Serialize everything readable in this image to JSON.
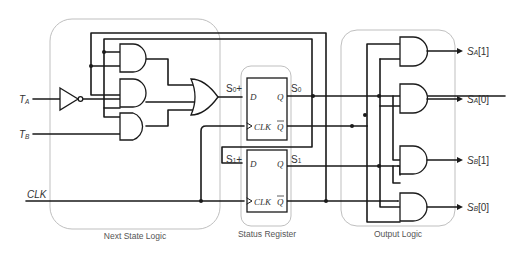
{
  "diagram": {
    "groups": {
      "next_state": "Next State Logic",
      "status_register": "Status Register",
      "output_logic": "Output Logic"
    },
    "inputs": {
      "ta": {
        "main": "T",
        "sub": "A"
      },
      "tb": {
        "main": "T",
        "sub": "B"
      },
      "clk": "CLK"
    },
    "signals": {
      "s0_plus": {
        "main": "S",
        "sub": "0",
        "suffix": "+"
      },
      "s1_plus": {
        "main": "S",
        "sub": "1",
        "suffix": "+"
      },
      "s0": {
        "main": "S",
        "sub": "0"
      },
      "s1": {
        "main": "S",
        "sub": "1"
      }
    },
    "flipflop_pins": {
      "d": "D",
      "q": "Q",
      "qbar": "Q",
      "clk": "CLK"
    },
    "outputs": [
      {
        "main": "S",
        "sub": "A",
        "index": "[1]"
      },
      {
        "main": "S",
        "sub": "A",
        "index": "[0]"
      },
      {
        "main": "S",
        "sub": "B",
        "index": "[1]"
      },
      {
        "main": "S",
        "sub": "B",
        "index": "[0]"
      }
    ],
    "colors": {
      "wire": "#1a1a1a",
      "group_outline": "#b8b8b8",
      "text": "#333333"
    }
  }
}
